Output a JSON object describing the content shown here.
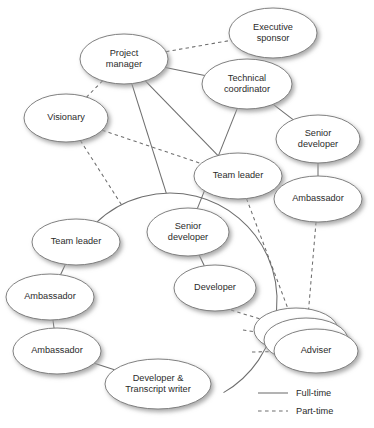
{
  "diagram": {
    "background": "#ffffff",
    "node_fill": "#ffffff",
    "node_stroke": "#7a7a7a",
    "shadow_color": "#9a9a9a",
    "edge_color": "#6e6e6e",
    "text_color": "#2b2b2b",
    "nodes": [
      {
        "id": "exec_sponsor",
        "label_lines": [
          "Executive",
          "sponsor"
        ],
        "cx": 273,
        "cy": 33,
        "rx": 44,
        "ry": 25
      },
      {
        "id": "project_manager",
        "label_lines": [
          "Project",
          "manager"
        ],
        "cx": 124,
        "cy": 59,
        "rx": 44,
        "ry": 25
      },
      {
        "id": "tech_coord",
        "label_lines": [
          "Technical",
          "coordinator"
        ],
        "cx": 247,
        "cy": 84,
        "rx": 45,
        "ry": 25
      },
      {
        "id": "visionary",
        "label_lines": [
          "Visionary"
        ],
        "cx": 66,
        "cy": 118,
        "rx": 42,
        "ry": 24
      },
      {
        "id": "senior_dev_r",
        "label_lines": [
          "Senior",
          "developer"
        ],
        "cx": 318,
        "cy": 139,
        "rx": 42,
        "ry": 24
      },
      {
        "id": "team_leader_c",
        "label_lines": [
          "Team leader"
        ],
        "cx": 238,
        "cy": 176,
        "rx": 44,
        "ry": 23
      },
      {
        "id": "ambassador_r",
        "label_lines": [
          "Ambassador"
        ],
        "cx": 318,
        "cy": 199,
        "rx": 44,
        "ry": 23
      },
      {
        "id": "senior_dev_c",
        "label_lines": [
          "Senior",
          "developer"
        ],
        "cx": 188,
        "cy": 232,
        "rx": 41,
        "ry": 24
      },
      {
        "id": "team_leader_l",
        "label_lines": [
          "Team leader"
        ],
        "cx": 76,
        "cy": 242,
        "rx": 44,
        "ry": 23
      },
      {
        "id": "developer",
        "label_lines": [
          "Developer"
        ],
        "cx": 215,
        "cy": 288,
        "rx": 41,
        "ry": 23
      },
      {
        "id": "ambassador_l1",
        "label_lines": [
          "Ambassador"
        ],
        "cx": 50,
        "cy": 297,
        "rx": 44,
        "ry": 23
      },
      {
        "id": "adviser_back2",
        "label_lines": [],
        "cx": 296,
        "cy": 330,
        "rx": 42,
        "ry": 22
      },
      {
        "id": "adviser_back1",
        "label_lines": [],
        "cx": 306,
        "cy": 340,
        "rx": 42,
        "ry": 22
      },
      {
        "id": "ambassador_l2",
        "label_lines": [
          "Ambassador"
        ],
        "cx": 57,
        "cy": 351,
        "rx": 44,
        "ry": 23
      },
      {
        "id": "adviser",
        "label_lines": [
          "Adviser"
        ],
        "cx": 316,
        "cy": 351,
        "rx": 42,
        "ry": 22
      },
      {
        "id": "dev_transcript",
        "label_lines": [
          "Developer &",
          "Transcript writer"
        ],
        "cx": 158,
        "cy": 384,
        "rx": 53,
        "ry": 25
      }
    ],
    "ring": {
      "cx": 170,
      "cy": 300,
      "r": 107,
      "start_deg": 200,
      "end_deg": 60
    },
    "edges": [
      {
        "from": "project_manager",
        "to": "exec_sponsor",
        "style": "part-time"
      },
      {
        "from": "project_manager",
        "to": "visionary",
        "style": "part-time"
      },
      {
        "from": "project_manager",
        "to": "tech_coord",
        "style": "full-time"
      },
      {
        "from": "project_manager",
        "to": "team_leader_c",
        "style": "full-time"
      },
      {
        "from": "project_manager",
        "to": "ring_top",
        "style": "full-time"
      },
      {
        "from": "tech_coord",
        "to": "senior_dev_r",
        "style": "full-time"
      },
      {
        "from": "tech_coord",
        "to": "senior_dev_c",
        "style": "full-time"
      },
      {
        "from": "visionary",
        "to": "team_leader_c",
        "style": "part-time"
      },
      {
        "from": "visionary",
        "to": "ring_topleft",
        "style": "part-time"
      },
      {
        "from": "senior_dev_r",
        "to": "ambassador_r",
        "style": "full-time"
      },
      {
        "from": "senior_dev_c",
        "to": "developer",
        "style": "full-time"
      },
      {
        "from": "team_leader_l",
        "to": "ambassador_l1",
        "style": "full-time"
      },
      {
        "from": "ambassador_l1",
        "to": "ambassador_l2",
        "style": "full-time"
      },
      {
        "from": "ambassador_l2",
        "to": "dev_transcript",
        "style": "full-time"
      },
      {
        "from": "team_leader_c",
        "to": "adviser_back2",
        "style": "part-time"
      },
      {
        "from": "ambassador_r",
        "to": "adviser_back1",
        "style": "part-time"
      },
      {
        "from": "ring_right_1",
        "to": "adviser_back2",
        "style": "part-time"
      },
      {
        "from": "ring_right_2",
        "to": "adviser_back1",
        "style": "part-time"
      },
      {
        "from": "ring_right_3",
        "to": "adviser",
        "style": "part-time"
      }
    ]
  },
  "legend": {
    "items": [
      {
        "label": "Full-time",
        "style": "solid"
      },
      {
        "label": "Part-time",
        "style": "dashed"
      }
    ]
  }
}
